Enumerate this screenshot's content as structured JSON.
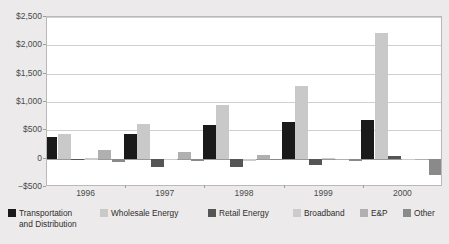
{
  "title_partial": "",
  "chart_data": {
    "type": "bar",
    "title": "",
    "xlabel": "",
    "ylabel": "",
    "categories": [
      "1996",
      "1997",
      "1998",
      "1999",
      "2000"
    ],
    "ylim": [
      -500,
      2500
    ],
    "ytick_values": [
      2500,
      2000,
      1500,
      1000,
      500,
      0,
      -500
    ],
    "ytick_labels": [
      "$2,500",
      "$2,000",
      "$1,500",
      "$1,000",
      "$500",
      "0",
      "−$500"
    ],
    "grid": "horizontal",
    "legend_position": "bottom",
    "series": [
      {
        "name": "Transportation and Distribution",
        "name_line1": "Transportation",
        "name_line2": "and Distribution",
        "color": "#1a1a1a",
        "values": [
          390,
          440,
          600,
          640,
          685
        ]
      },
      {
        "name": "Wholesale Energy",
        "name_line1": "Wholesale Energy",
        "name_line2": "",
        "color": "#c9c9c9",
        "values": [
          430,
          610,
          940,
          1285,
          2215
        ]
      },
      {
        "name": "Retail Energy",
        "name_line1": "Retail Energy",
        "name_line2": "",
        "color": "#555555",
        "values": [
          -15,
          -140,
          -140,
          -110,
          45
        ]
      },
      {
        "name": "Broadband",
        "name_line1": "Broadband",
        "name_line2": "",
        "color": "#cccccc",
        "values": [
          5,
          -30,
          -40,
          20,
          -25
        ]
      },
      {
        "name": "E&P",
        "name_line1": "E&P",
        "name_line2": "",
        "color": "#b0b0b0",
        "values": [
          155,
          125,
          60,
          -30,
          -15
        ]
      },
      {
        "name": "Other",
        "name_line1": "Other",
        "name_line2": "",
        "color": "#8a8a8a",
        "values": [
          -55,
          -40,
          -30,
          -40,
          -290
        ]
      }
    ]
  }
}
